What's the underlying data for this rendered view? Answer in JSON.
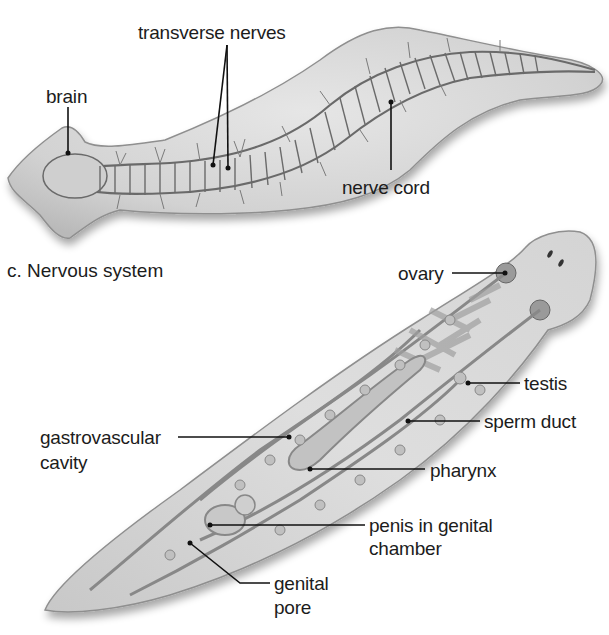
{
  "figure": {
    "panel_c": {
      "caption": "c. Nervous system",
      "labels": {
        "transverse_nerves": "transverse nerves",
        "brain": "brain",
        "nerve_cord": "nerve cord"
      }
    },
    "panel_reproductive": {
      "labels": {
        "ovary": "ovary",
        "testis": "testis",
        "sperm_duct": "sperm duct",
        "gastrovascular_cavity_line1": "gastrovascular",
        "gastrovascular_cavity_line2": "cavity",
        "pharynx": "pharynx",
        "penis_line1": "penis in genital",
        "penis_line2": "chamber",
        "genital_pore_line1": "genital",
        "genital_pore_line2": "pore"
      }
    },
    "colors": {
      "body_fill": "#d6d6d6",
      "body_edge": "#8a8a8a",
      "nerve": "#5a5a5a",
      "leader_line": "#111111"
    }
  }
}
